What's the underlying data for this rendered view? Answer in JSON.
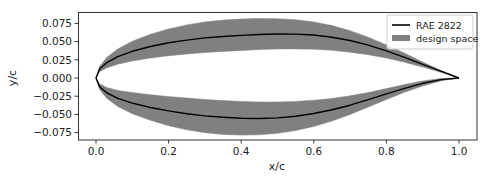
{
  "chart_data": {
    "type": "area",
    "title": "",
    "xlabel": "x/c",
    "ylabel": "y/c",
    "xlim": [
      -0.05,
      1.05
    ],
    "ylim": [
      -0.085,
      0.092
    ],
    "grid": false,
    "legend_position": "upper right",
    "xticks": [
      0.0,
      0.2,
      0.4,
      0.6,
      0.8,
      1.0
    ],
    "xtick_labels": [
      "0.0",
      "0.2",
      "0.4",
      "0.6",
      "0.8",
      "1.0"
    ],
    "yticks": [
      0.075,
      0.05,
      0.025,
      0.0,
      -0.025,
      -0.05,
      -0.075
    ],
    "ytick_labels": [
      "0.075",
      "0.050",
      "0.025",
      "0.000",
      "−0.025",
      "−0.050",
      "−0.075"
    ],
    "legend": [
      {
        "label": "RAE 2822",
        "kind": "line",
        "color": "#000000"
      },
      {
        "label": "design space",
        "kind": "patch",
        "color": "#808080"
      }
    ],
    "x": [
      0.0,
      0.01,
      0.03,
      0.06,
      0.1,
      0.15,
      0.2,
      0.25,
      0.3,
      0.35,
      0.4,
      0.45,
      0.5,
      0.55,
      0.6,
      0.65,
      0.7,
      0.75,
      0.8,
      0.85,
      0.9,
      0.95,
      1.0
    ],
    "series": [
      {
        "name": "RAE 2822 upper",
        "values": [
          0.0,
          0.0122,
          0.0212,
          0.0293,
          0.0367,
          0.0433,
          0.0484,
          0.0521,
          0.0551,
          0.057,
          0.0585,
          0.0598,
          0.0605,
          0.0603,
          0.059,
          0.0561,
          0.0515,
          0.0452,
          0.0374,
          0.0284,
          0.0187,
          0.0093,
          0.0
        ]
      },
      {
        "name": "RAE 2822 lower",
        "values": [
          0.0,
          -0.012,
          -0.0205,
          -0.028,
          -0.0345,
          -0.0405,
          -0.0452,
          -0.049,
          -0.052,
          -0.054,
          -0.0553,
          -0.0556,
          -0.0548,
          -0.0525,
          -0.0488,
          -0.0437,
          -0.0373,
          -0.0298,
          -0.0218,
          -0.0141,
          -0.0073,
          -0.0022,
          0.0
        ]
      },
      {
        "name": "design space upper outer",
        "values": [
          0.0,
          0.016,
          0.0285,
          0.04,
          0.0505,
          0.06,
          0.0675,
          0.073,
          0.077,
          0.0795,
          0.081,
          0.0818,
          0.0815,
          0.08,
          0.077,
          0.072,
          0.065,
          0.056,
          0.0455,
          0.034,
          0.022,
          0.0105,
          0.0
        ]
      },
      {
        "name": "design space upper inner",
        "values": [
          0.0,
          0.0085,
          0.014,
          0.019,
          0.0235,
          0.0275,
          0.0305,
          0.033,
          0.035,
          0.0365,
          0.0378,
          0.039,
          0.0398,
          0.04,
          0.0395,
          0.038,
          0.0355,
          0.032,
          0.0275,
          0.0215,
          0.015,
          0.0078,
          0.0
        ]
      },
      {
        "name": "design space lower outer",
        "values": [
          0.0,
          -0.016,
          -0.028,
          -0.039,
          -0.049,
          -0.058,
          -0.0655,
          -0.0712,
          -0.0752,
          -0.0775,
          -0.0785,
          -0.078,
          -0.076,
          -0.0722,
          -0.0665,
          -0.059,
          -0.05,
          -0.04,
          -0.0295,
          -0.0195,
          -0.011,
          -0.004,
          0.0
        ]
      },
      {
        "name": "design space lower inner",
        "values": [
          0.0,
          -0.008,
          -0.013,
          -0.017,
          -0.02,
          -0.023,
          -0.0255,
          -0.0275,
          -0.0295,
          -0.031,
          -0.0322,
          -0.033,
          -0.033,
          -0.0322,
          -0.0305,
          -0.028,
          -0.0245,
          -0.02,
          -0.0145,
          -0.009,
          -0.004,
          -0.0008,
          0.0
        ]
      }
    ]
  },
  "colors": {
    "line": "#000000",
    "band": "#808080",
    "axes": "#333333"
  }
}
